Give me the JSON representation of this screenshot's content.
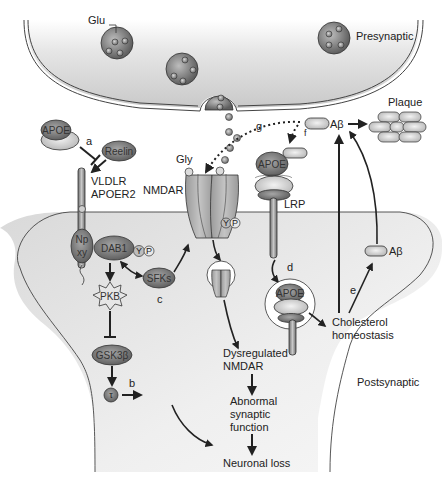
{
  "diagram": {
    "regions": {
      "presynaptic": "Presynaptic",
      "postsynaptic": "Postsynaptic"
    },
    "molecules": {
      "glu": "Glu",
      "gly": "Gly",
      "apoe": "APOE",
      "reelin": "Reelin",
      "receptor_line1": "VLDLR",
      "receptor_line2": "APOER2",
      "nmdar": "NMDAR",
      "lrp": "LRP",
      "npxy_top": "Np",
      "npxy_bottom": "xy",
      "dab1": "DAB1",
      "y": "Y",
      "p": "P",
      "sfks": "SFKs",
      "pkb": "PKB",
      "gsk3b": "GSK3β",
      "tau": "τ",
      "nft": "NFT",
      "abeta": "Aβ",
      "plaque": "Plaque"
    },
    "outcomes": {
      "cholesterol_line1": "Cholesterol",
      "cholesterol_line2": "homeostasis",
      "dysregulated_line1": "Dysregulated",
      "dysregulated_line2": "NMDAR",
      "abnormal_line1": "Abnormal",
      "abnormal_line2": "synaptic",
      "abnormal_line3": "function",
      "neuronal_loss": "Neuronal loss"
    },
    "pathway_labels": {
      "a": "a",
      "b": "b",
      "c": "c",
      "d": "d",
      "e": "e",
      "f": "f",
      "g": "g"
    },
    "colors": {
      "cell_fill": "#e4e4e4",
      "molecule_dark": "#7d7d7d",
      "molecule_light": "#cfcfcf",
      "arrow": "#222222"
    }
  }
}
